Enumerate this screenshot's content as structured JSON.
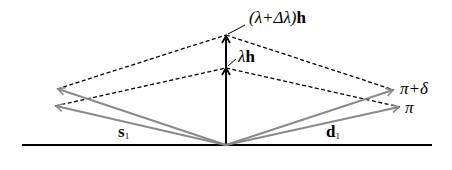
{
  "diagram": {
    "labels": {
      "top_scaled": {
        "prefix": "(λ+Δλ)",
        "vec": "h"
      },
      "scaled": {
        "prefix": "λ",
        "vec": "h"
      },
      "pi_plus_delta": "π+δ",
      "pi": "π",
      "s": {
        "vec": "s",
        "sub": "1"
      },
      "d": {
        "vec": "d",
        "sub": "1"
      }
    },
    "colors": {
      "line": "#000000",
      "ray": "#8a8a8a",
      "dashed": "#000000"
    }
  }
}
